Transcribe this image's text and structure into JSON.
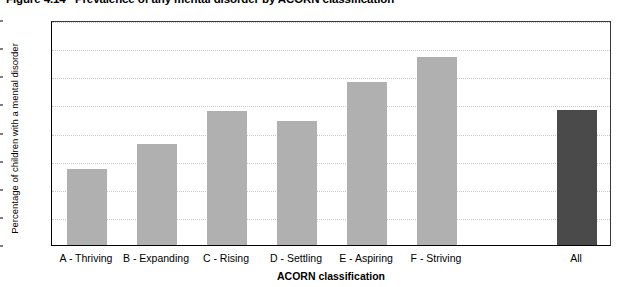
{
  "chart_data": {
    "type": "bar",
    "title": "Figure 4.14   Prevalence of any mental disorder by ACORN classification",
    "xlabel": "ACORN classification",
    "ylabel": "Percentage of children with a mental disorder",
    "categories": [
      "A - Thriving",
      "B - Expanding",
      "C - Rising",
      "D - Settling",
      "E - Aspiring",
      "F - Striving",
      "All"
    ],
    "values": [
      5.4,
      7.2,
      9.5,
      8.8,
      11.6,
      13.4,
      9.6
    ],
    "ylim": [
      0,
      16
    ],
    "ytick_labels": [
      "0",
      "2",
      "4",
      "6",
      "8",
      "10",
      "12",
      "14",
      "16"
    ],
    "ytick_values": [
      0,
      2,
      4,
      6,
      8,
      10,
      12,
      14,
      16
    ],
    "grid": true,
    "grid_axis": "y",
    "legend": "none",
    "bar_colors": [
      "#b0b0b0",
      "#b0b0b0",
      "#b0b0b0",
      "#b0b0b0",
      "#b0b0b0",
      "#b0b0b0",
      "#4a4a4a"
    ],
    "series_color": "#b0b0b0",
    "total_color": "#4a4a4a",
    "bar_slots": [
      0,
      1,
      2,
      3,
      4,
      5,
      7
    ]
  }
}
